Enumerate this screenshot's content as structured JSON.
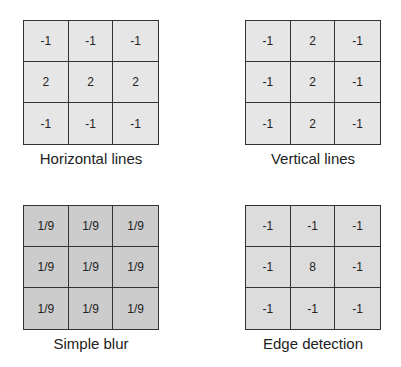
{
  "kernels": [
    {
      "caption": "Horizontal lines",
      "fill": "#e6e6e6",
      "cells": [
        "-1",
        "-1",
        "-1",
        "2",
        "2",
        "2",
        "-1",
        "-1",
        "-1"
      ]
    },
    {
      "caption": "Vertical lines",
      "fill": "#e6e6e6",
      "cells": [
        "-1",
        "2",
        "-1",
        "-1",
        "2",
        "-1",
        "-1",
        "2",
        "-1"
      ]
    },
    {
      "caption": "Simple blur",
      "fill": "#cccccc",
      "cells": [
        "1/9",
        "1/9",
        "1/9",
        "1/9",
        "1/9",
        "1/9",
        "1/9",
        "1/9",
        "1/9"
      ]
    },
    {
      "caption": "Edge detection",
      "fill": "#dcdcdc",
      "cells": [
        "-1",
        "-1",
        "-1",
        "-1",
        "8",
        "-1",
        "-1",
        "-1",
        "-1"
      ]
    }
  ]
}
